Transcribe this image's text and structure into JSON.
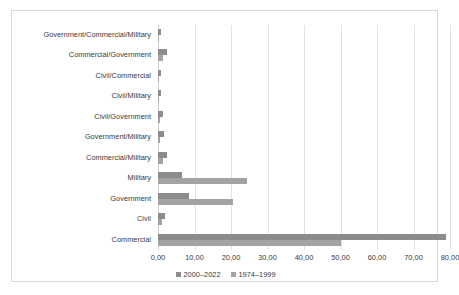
{
  "chart_data": {
    "type": "bar",
    "orientation": "horizontal",
    "title": "",
    "subtitle": "",
    "xlabel": "",
    "ylabel": "",
    "xlim": [
      0,
      80
    ],
    "xticks": [
      0,
      10,
      20,
      30,
      40,
      50,
      60,
      70,
      80
    ],
    "xtick_labels": [
      "0,00",
      "10,00",
      "20,00",
      "30,00",
      "40,00",
      "50,00",
      "60,00",
      "70,00",
      "80,00"
    ],
    "grid": true,
    "legend_position": "bottom-center",
    "categories": [
      "Government/Commercial/Military",
      "Commercial/Government",
      "Civil/Commercial",
      "Civil/Military",
      "Civil/Government",
      "Government/Military",
      "Commercial/Military",
      "Military",
      "Government",
      "Civil",
      "Commercial"
    ],
    "series": [
      {
        "name": "2000-2022",
        "color": "#8c8c8c",
        "values": [
          0.8,
          2.6,
          0.8,
          0.8,
          1.4,
          1.6,
          2.4,
          6.6,
          8.6,
          1.8,
          79.0
        ]
      },
      {
        "name": "1974-1999",
        "color": "#a3a3a3",
        "values": [
          0.3,
          1.4,
          0.3,
          0.3,
          0.5,
          0.5,
          1.5,
          24.3,
          20.5,
          1.0,
          50.2
        ]
      }
    ]
  },
  "legend": {
    "entries": [
      {
        "label": "2000–2022"
      },
      {
        "label": "1974–1999"
      }
    ]
  },
  "colors": {
    "series_2000_2022": "#8c8c8c",
    "series_1974_1999": "#a3a3a3",
    "gridline": "#e2e2e2",
    "border": "#d8d8d8",
    "text": "#3a3a3a",
    "background": "#ffffff"
  }
}
